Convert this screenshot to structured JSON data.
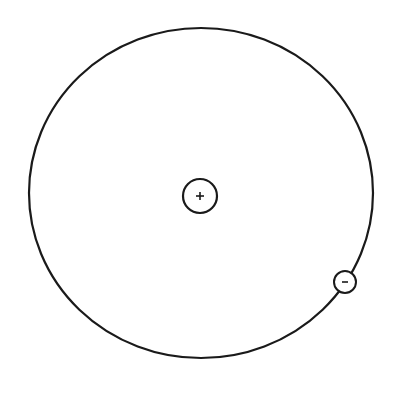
{
  "diagram": {
    "type": "atom-model",
    "background": "#ffffff",
    "stroke_color": "#1a1a1a",
    "orbit": {
      "cx": 201,
      "cy": 193,
      "rx": 172,
      "ry": 165,
      "stroke_width": 2.2
    },
    "nucleus": {
      "cx": 200,
      "cy": 196,
      "r": 17,
      "symbol": "+",
      "charge": "positive"
    },
    "electron": {
      "cx": 345,
      "cy": 282,
      "r": 11,
      "symbol": "-",
      "charge": "negative"
    }
  }
}
